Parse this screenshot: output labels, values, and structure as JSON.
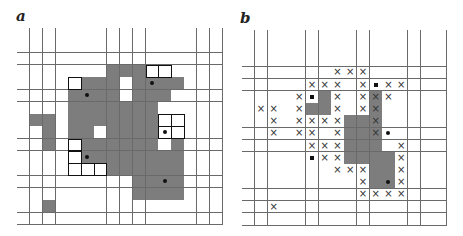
{
  "panels": [
    {
      "label": "a",
      "rows": 16,
      "cols": 16,
      "origin": [
        17,
        28
      ],
      "cell": [
        12.85,
        12.3
      ],
      "grey_cells": [
        [
          3,
          7
        ],
        [
          3,
          8
        ],
        [
          3,
          9
        ],
        [
          4,
          5
        ],
        [
          4,
          6
        ],
        [
          4,
          7
        ],
        [
          4,
          9
        ],
        [
          4,
          10
        ],
        [
          4,
          11
        ],
        [
          4,
          12
        ],
        [
          5,
          4
        ],
        [
          5,
          5
        ],
        [
          5,
          6
        ],
        [
          5,
          7
        ],
        [
          5,
          9
        ],
        [
          5,
          10
        ],
        [
          5,
          11
        ],
        [
          6,
          4
        ],
        [
          6,
          5
        ],
        [
          6,
          6
        ],
        [
          6,
          7
        ],
        [
          6,
          8
        ],
        [
          6,
          9
        ],
        [
          6,
          10
        ],
        [
          7,
          1
        ],
        [
          7,
          2
        ],
        [
          7,
          4
        ],
        [
          7,
          5
        ],
        [
          7,
          6
        ],
        [
          7,
          7
        ],
        [
          7,
          8
        ],
        [
          7,
          9
        ],
        [
          7,
          10
        ],
        [
          8,
          2
        ],
        [
          8,
          4
        ],
        [
          8,
          5
        ],
        [
          8,
          7
        ],
        [
          8,
          8
        ],
        [
          8,
          9
        ],
        [
          8,
          10
        ],
        [
          9,
          2
        ],
        [
          9,
          5
        ],
        [
          9,
          6
        ],
        [
          9,
          7
        ],
        [
          9,
          8
        ],
        [
          9,
          9
        ],
        [
          9,
          10
        ],
        [
          9,
          12
        ],
        [
          10,
          5
        ],
        [
          10,
          6
        ],
        [
          10,
          7
        ],
        [
          10,
          8
        ],
        [
          10,
          9
        ],
        [
          10,
          10
        ],
        [
          10,
          11
        ],
        [
          10,
          12
        ],
        [
          11,
          7
        ],
        [
          11,
          8
        ],
        [
          11,
          9
        ],
        [
          11,
          10
        ],
        [
          11,
          11
        ],
        [
          11,
          12
        ],
        [
          12,
          9
        ],
        [
          12,
          10
        ],
        [
          12,
          11
        ],
        [
          12,
          12
        ],
        [
          13,
          9
        ],
        [
          13,
          10
        ],
        [
          13,
          11
        ],
        [
          13,
          12
        ],
        [
          14,
          2
        ]
      ],
      "outlined_cells": [
        [
          3,
          10
        ],
        [
          3,
          11
        ],
        [
          4,
          4
        ],
        [
          7,
          11
        ],
        [
          7,
          12
        ],
        [
          8,
          11
        ],
        [
          8,
          12
        ],
        [
          9,
          4
        ],
        [
          10,
          4
        ],
        [
          11,
          4
        ],
        [
          11,
          5
        ],
        [
          11,
          6
        ]
      ],
      "dot_cells": [
        [
          4,
          10
        ],
        [
          5,
          5
        ],
        [
          8,
          11
        ],
        [
          10,
          5
        ],
        [
          12,
          11
        ]
      ],
      "square_cells": [],
      "x_cells": []
    },
    {
      "label": "b",
      "rows": 16,
      "cols": 16,
      "origin": [
        242,
        30
      ],
      "cell": [
        12.75,
        12.2
      ],
      "grey_cells": [
        [
          5,
          6
        ],
        [
          5,
          10
        ],
        [
          6,
          5
        ],
        [
          6,
          6
        ],
        [
          6,
          10
        ],
        [
          7,
          8
        ],
        [
          7,
          9
        ],
        [
          7,
          10
        ],
        [
          8,
          8
        ],
        [
          8,
          9
        ],
        [
          8,
          10
        ],
        [
          9,
          8
        ],
        [
          9,
          9
        ],
        [
          9,
          10
        ],
        [
          10,
          8
        ],
        [
          10,
          9
        ],
        [
          10,
          10
        ],
        [
          10,
          11
        ],
        [
          11,
          10
        ],
        [
          11,
          11
        ],
        [
          12,
          10
        ],
        [
          12,
          11
        ]
      ],
      "outlined_cells": [],
      "dot_cells": [
        [
          8,
          11
        ],
        [
          12,
          11
        ]
      ],
      "square_cells": [
        [
          4,
          10
        ],
        [
          5,
          5
        ],
        [
          10,
          5
        ]
      ],
      "x_cells": [
        [
          3,
          7
        ],
        [
          3,
          8
        ],
        [
          3,
          9
        ],
        [
          4,
          5
        ],
        [
          4,
          6
        ],
        [
          4,
          7
        ],
        [
          4,
          9
        ],
        [
          4,
          11
        ],
        [
          4,
          12
        ],
        [
          5,
          4
        ],
        [
          5,
          7
        ],
        [
          5,
          9
        ],
        [
          5,
          10
        ],
        [
          5,
          11
        ],
        [
          6,
          1
        ],
        [
          6,
          2
        ],
        [
          6,
          4
        ],
        [
          6,
          7
        ],
        [
          6,
          9
        ],
        [
          6,
          10
        ],
        [
          7,
          2
        ],
        [
          7,
          4
        ],
        [
          7,
          5
        ],
        [
          7,
          6
        ],
        [
          7,
          7
        ],
        [
          7,
          10
        ],
        [
          8,
          2
        ],
        [
          8,
          4
        ],
        [
          8,
          5
        ],
        [
          8,
          7
        ],
        [
          8,
          10
        ],
        [
          9,
          5
        ],
        [
          9,
          6
        ],
        [
          9,
          7
        ],
        [
          9,
          12
        ],
        [
          10,
          6
        ],
        [
          10,
          7
        ],
        [
          10,
          12
        ],
        [
          11,
          7
        ],
        [
          11,
          8
        ],
        [
          11,
          9
        ],
        [
          11,
          12
        ],
        [
          12,
          9
        ],
        [
          12,
          12
        ],
        [
          13,
          9
        ],
        [
          13,
          10
        ],
        [
          13,
          11
        ],
        [
          13,
          12
        ],
        [
          14,
          2
        ]
      ]
    }
  ],
  "symbols": {
    "x_mark": "×",
    "dot": "filled-circle",
    "square": "filled-square"
  },
  "colors": {
    "grey_cell": "#7d7d7d",
    "grid_line": "#6a6a6a",
    "marker": "#111111"
  }
}
